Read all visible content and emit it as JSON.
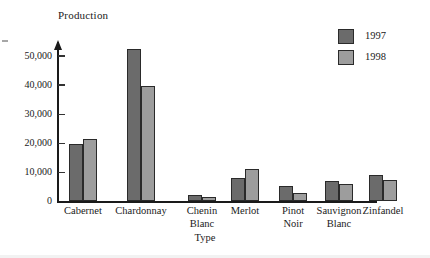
{
  "chart_data": {
    "type": "bar",
    "title": "",
    "ylabel": "Production",
    "xlabel": "Type",
    "categories": [
      "Cabernet",
      "Chardonnay",
      "Chenin Blanc",
      "Merlot",
      "Pinot Noir",
      "Sauvignon Blanc",
      "Zinfandel"
    ],
    "category_lines": [
      [
        "Cabernet",
        ""
      ],
      [
        "Chardonnay",
        ""
      ],
      [
        "Chenin",
        "Blanc"
      ],
      [
        "Merlot",
        ""
      ],
      [
        "Pinot",
        "Noir"
      ],
      [
        "Sauvignon",
        "Blanc"
      ],
      [
        "Zinfandel",
        ""
      ]
    ],
    "series": [
      {
        "name": "1997",
        "color": "#6b6b6b",
        "values": [
          19800,
          52500,
          2300,
          8200,
          5400,
          7100,
          9000
        ]
      },
      {
        "name": "1998",
        "color": "#9d9d9d",
        "values": [
          21400,
          39800,
          1500,
          11100,
          3000,
          6100,
          7400
        ]
      }
    ],
    "ylim": [
      0,
      55000
    ],
    "yticks": [
      0,
      10000,
      20000,
      30000,
      40000,
      50000
    ],
    "ytick_labels": [
      "0",
      "10,000",
      "20,000",
      "30,000",
      "40,000",
      "50,000"
    ],
    "grid": false,
    "legend_position": "top-right",
    "axis_arrow": "up"
  },
  "legend": {
    "entries": [
      {
        "label": "1997",
        "color": "#6b6b6b"
      },
      {
        "label": "1998",
        "color": "#9d9d9d"
      }
    ]
  }
}
